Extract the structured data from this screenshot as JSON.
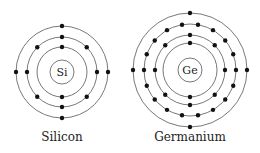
{
  "atoms": [
    {
      "symbol": "Si",
      "name": "Silicon",
      "cx": 62,
      "cy": 72,
      "shells": [
        {
          "r": 25,
          "n": 2,
          "offset": -90
        },
        {
          "r": 35,
          "n": 8,
          "offset": -90
        },
        {
          "r": 46,
          "n": 4,
          "offset": -90
        }
      ],
      "nucleus_r": 12
    },
    {
      "symbol": "Ge",
      "name": "Germanium",
      "cx": 190,
      "cy": 70,
      "shells": [
        {
          "r": 27,
          "n": 2,
          "offset": -90
        },
        {
          "r": 35,
          "n": 8,
          "offset": -90
        },
        {
          "r": 46,
          "n": 18,
          "offset": -80
        },
        {
          "r": 57,
          "n": 4,
          "offset": -90
        }
      ],
      "nucleus_r": 12
    }
  ],
  "colors": {
    "line": "#555555",
    "dot": "#111111"
  }
}
